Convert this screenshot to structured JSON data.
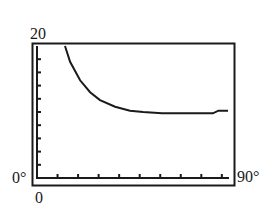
{
  "chart_data": {
    "type": "line",
    "title": "",
    "xlabel": "",
    "ylabel": "",
    "xlim": [
      0,
      90
    ],
    "ylim": [
      0,
      20
    ],
    "x_unit": "degrees",
    "grid": false,
    "legend": null,
    "tick_labels": {
      "y_max": "20",
      "y_min": "0",
      "x_min": "0°",
      "x_max": "90°"
    },
    "y_tick_count": 10,
    "x_tick_count": 9,
    "series": [
      {
        "name": "curve",
        "x": [
          13.2,
          15.6,
          20.3,
          25.0,
          29.7,
          36.8,
          43.8,
          50.0,
          58.9,
          70.0,
          82.9,
          85.5,
          90.0
        ],
        "y": [
          20.0,
          17.6,
          14.8,
          13.0,
          11.8,
          10.8,
          10.2,
          10.0,
          9.8,
          9.8,
          9.8,
          10.2,
          10.2
        ]
      }
    ]
  },
  "labels": {
    "y_top": "20",
    "x_left": "0°",
    "y_bottom": "0",
    "x_right": "90°"
  },
  "colors": {
    "ink": "#1a1a1a",
    "background": "#ffffff"
  }
}
